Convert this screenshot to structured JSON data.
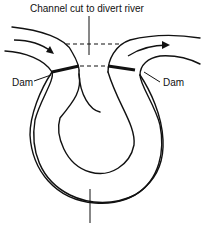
{
  "diagram": {
    "title_label": "Channel cut to divert river",
    "dam_left_label": "Dam",
    "dam_right_label": "Dam",
    "bottom_label": "",
    "colors": {
      "line": "#111111",
      "background": "#ffffff"
    }
  }
}
